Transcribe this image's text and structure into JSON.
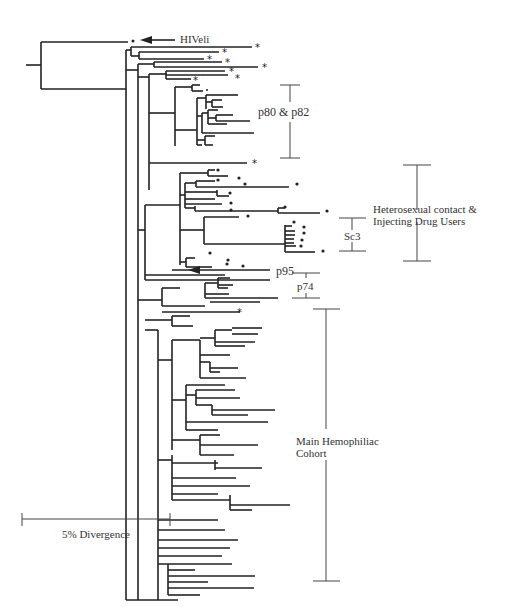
{
  "figure": {
    "type": "phylogenetic-tree",
    "labels": {
      "hiveli": "HIVeli",
      "p80_p82": "p80 & p82",
      "hetero_line1": "Heterosexual contact &",
      "hetero_line2": "Injecting Drug Users",
      "sc3": "Sc3",
      "p95": "p95",
      "p74": "p74",
      "hemo_line1": "Main Hemophiliac",
      "hemo_line2": "Cohort",
      "scale": "5% Divergence"
    },
    "scale_bar": {
      "label": "5% Divergence",
      "percent": 5
    },
    "clades": [
      {
        "name": "HIVeli",
        "marker": "arrow",
        "role": "outgroup"
      },
      {
        "name": "p80 & p82",
        "marker": "bracket"
      },
      {
        "name": "Heterosexual contact & Injecting Drug Users",
        "marker": "bracket"
      },
      {
        "name": "Sc3",
        "marker": "bracket",
        "parent": "Heterosexual contact & Injecting Drug Users"
      },
      {
        "name": "p95",
        "marker": "arrow"
      },
      {
        "name": "p74",
        "marker": "bracket"
      },
      {
        "name": "Main Hemophiliac Cohort",
        "marker": "bracket"
      }
    ],
    "leaf_markers": {
      "asterisk": "*",
      "dot": "•"
    }
  }
}
